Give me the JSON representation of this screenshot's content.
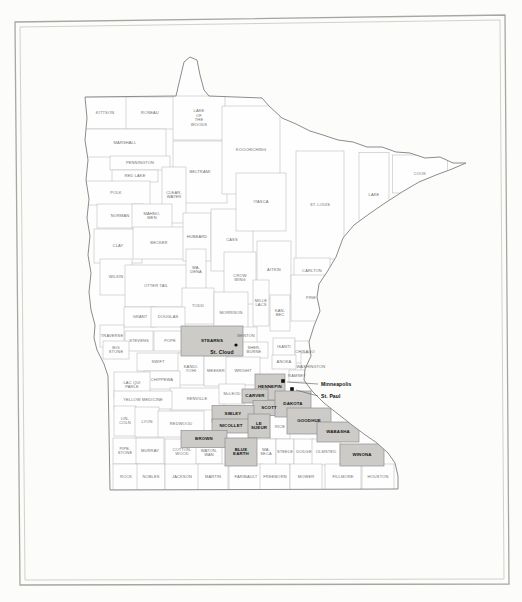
{
  "colors": {
    "paper": "#fcfcfb",
    "frame_outer": "#a9a6a0",
    "frame_inner": "#c8c5c0",
    "county_line": "#b2b2b2",
    "county_fill": "#fefefe",
    "state_line": "#8c8c8c",
    "highlight_fill": "#cccbc8",
    "highlight_line": "#8f8f8f",
    "label": "#6e6e6e",
    "label_highlight": "#161616",
    "city": "#111111",
    "leader_line": "#555555"
  },
  "map": {
    "counties": [
      {
        "name": "KITTSON",
        "x": 105,
        "y": 113,
        "w": 44,
        "h": 32,
        "hl": false
      },
      {
        "name": "ROSEAU",
        "x": 150,
        "y": 113,
        "w": 48,
        "h": 32,
        "hl": false
      },
      {
        "name": "LAKE OF THE WOODS",
        "x": 199,
        "y": 118,
        "w": 52,
        "h": 44,
        "hl": false,
        "lines": [
          "LAKE",
          "OF",
          "THE",
          "WOODS"
        ]
      },
      {
        "name": "MARSHALL",
        "x": 125,
        "y": 143,
        "w": 82,
        "h": 28,
        "hl": false
      },
      {
        "name": "PENNINGTON",
        "x": 140,
        "y": 163,
        "w": 60,
        "h": 14,
        "hl": false
      },
      {
        "name": "RED LAKE",
        "x": 135,
        "y": 176,
        "w": 46,
        "h": 12,
        "hl": false
      },
      {
        "name": "BELTRAMI",
        "x": 200,
        "y": 172,
        "w": 54,
        "h": 62,
        "hl": false
      },
      {
        "name": "KOOCHICHING",
        "x": 251,
        "y": 150,
        "w": 58,
        "h": 88,
        "hl": false
      },
      {
        "name": "POLK",
        "x": 116,
        "y": 193,
        "w": 68,
        "h": 24,
        "hl": false
      },
      {
        "name": "CLEARWATER",
        "x": 174,
        "y": 195,
        "w": 24,
        "h": 56,
        "hl": false,
        "lines": [
          "CLEAR-",
          "WATER"
        ]
      },
      {
        "name": "NORMAN",
        "x": 120,
        "y": 216,
        "w": 46,
        "h": 24,
        "hl": false
      },
      {
        "name": "MAHNOMEN",
        "x": 152,
        "y": 216,
        "w": 40,
        "h": 24,
        "hl": false,
        "lines": [
          "MAHNO-",
          "MEN"
        ]
      },
      {
        "name": "CLAY",
        "x": 118,
        "y": 246,
        "w": 48,
        "h": 34,
        "hl": false
      },
      {
        "name": "BECKER",
        "x": 159,
        "y": 243,
        "w": 52,
        "h": 32,
        "hl": false
      },
      {
        "name": "HUBBARD",
        "x": 197,
        "y": 237,
        "w": 28,
        "h": 48,
        "hl": false
      },
      {
        "name": "CASS",
        "x": 232,
        "y": 240,
        "w": 42,
        "h": 62,
        "hl": false
      },
      {
        "name": "ITASCA",
        "x": 261,
        "y": 202,
        "w": 50,
        "h": 58,
        "hl": false
      },
      {
        "name": "ST. LOUIS",
        "x": 320,
        "y": 205,
        "w": 48,
        "h": 108,
        "hl": false
      },
      {
        "name": "LAKE",
        "x": 374,
        "y": 195,
        "w": 30,
        "h": 85,
        "hl": false
      },
      {
        "name": "COOK",
        "x": 420,
        "y": 174,
        "w": 55,
        "h": 38,
        "hl": false
      },
      {
        "name": "WILKIN",
        "x": 116,
        "y": 277,
        "w": 32,
        "h": 36,
        "hl": false
      },
      {
        "name": "OTTER TAIL",
        "x": 156,
        "y": 286,
        "w": 62,
        "h": 42,
        "hl": false
      },
      {
        "name": "WADENA",
        "x": 196,
        "y": 270,
        "w": 20,
        "h": 42,
        "hl": false,
        "lines": [
          "WA-",
          "DENA"
        ]
      },
      {
        "name": "CROW WING",
        "x": 240,
        "y": 278,
        "w": 32,
        "h": 52,
        "hl": false,
        "lines": [
          "CROW",
          "WING"
        ]
      },
      {
        "name": "AITKIN",
        "x": 274,
        "y": 270,
        "w": 34,
        "h": 58,
        "hl": false
      },
      {
        "name": "CARLTON",
        "x": 312,
        "y": 271,
        "w": 36,
        "h": 26,
        "hl": false
      },
      {
        "name": "TODD",
        "x": 198,
        "y": 306,
        "w": 32,
        "h": 36,
        "hl": false
      },
      {
        "name": "MORRISON",
        "x": 231,
        "y": 313,
        "w": 34,
        "h": 42,
        "hl": false
      },
      {
        "name": "MILLE LACS",
        "x": 261,
        "y": 303,
        "w": 16,
        "h": 46,
        "hl": false,
        "lines": [
          "MILLE",
          "LACS"
        ]
      },
      {
        "name": "KANABEC",
        "x": 280,
        "y": 313,
        "w": 20,
        "h": 36,
        "hl": false,
        "lines": [
          "KAN-",
          "BEC"
        ]
      },
      {
        "name": "PINE",
        "x": 311,
        "y": 298,
        "w": 40,
        "h": 46,
        "hl": false
      },
      {
        "name": "GRANT",
        "x": 140,
        "y": 317,
        "w": 32,
        "h": 20,
        "hl": false
      },
      {
        "name": "DOUGLAS",
        "x": 168,
        "y": 317,
        "w": 34,
        "h": 20,
        "hl": false
      },
      {
        "name": "TRAVERSE",
        "x": 112,
        "y": 336,
        "w": 24,
        "h": 22,
        "hl": false
      },
      {
        "name": "STEVENS",
        "x": 139,
        "y": 341,
        "w": 28,
        "h": 20,
        "hl": false
      },
      {
        "name": "POPE",
        "x": 170,
        "y": 341,
        "w": 32,
        "h": 20,
        "hl": false
      },
      {
        "name": "BIG STONE",
        "x": 116,
        "y": 350,
        "w": 26,
        "h": 18,
        "hl": false,
        "lines": [
          "BIG",
          "STONE"
        ]
      },
      {
        "name": "STEARNS",
        "x": 212,
        "y": 341,
        "w": 62,
        "h": 30,
        "hl": true
      },
      {
        "name": "BENTON",
        "x": 246,
        "y": 336,
        "w": 22,
        "h": 18,
        "hl": false
      },
      {
        "name": "SHERBURNE",
        "x": 254,
        "y": 350,
        "w": 28,
        "h": 16,
        "hl": false,
        "lines": [
          "SHER-",
          "BURNE"
        ]
      },
      {
        "name": "ISANTI",
        "x": 284,
        "y": 347,
        "w": 22,
        "h": 18,
        "hl": false
      },
      {
        "name": "CHISAGO",
        "x": 305,
        "y": 352,
        "w": 20,
        "h": 22,
        "hl": false
      },
      {
        "name": "ANOKA",
        "x": 284,
        "y": 362,
        "w": 24,
        "h": 14,
        "hl": false
      },
      {
        "name": "SWIFT",
        "x": 158,
        "y": 362,
        "w": 42,
        "h": 18,
        "hl": false
      },
      {
        "name": "KANDIYOHI",
        "x": 191,
        "y": 369,
        "w": 26,
        "h": 32,
        "hl": false,
        "lines": [
          "KANDI-",
          "YOHI"
        ]
      },
      {
        "name": "MEEKER",
        "x": 216,
        "y": 371,
        "w": 24,
        "h": 30,
        "hl": false
      },
      {
        "name": "WRIGHT",
        "x": 243,
        "y": 371,
        "w": 34,
        "h": 28,
        "hl": false
      },
      {
        "name": "CHIPPEWA",
        "x": 162,
        "y": 380,
        "w": 36,
        "h": 18,
        "hl": false
      },
      {
        "name": "LAC QUI PARLE",
        "x": 132,
        "y": 385,
        "w": 36,
        "h": 26,
        "hl": false,
        "lines": [
          "LAC QUI",
          "PARLE"
        ]
      },
      {
        "name": "RENVILLE",
        "x": 197,
        "y": 399,
        "w": 54,
        "h": 22,
        "hl": false
      },
      {
        "name": "McLEOD",
        "x": 232,
        "y": 394,
        "w": 26,
        "h": 20,
        "hl": false
      },
      {
        "name": "WASHINGTON",
        "x": 311,
        "y": 367,
        "w": 20,
        "h": 28,
        "hl": false
      },
      {
        "name": "RAMSEY",
        "x": 297,
        "y": 376,
        "w": 16,
        "h": 12,
        "hl": false
      },
      {
        "name": "HENNEPIN",
        "x": 270,
        "y": 387,
        "w": 30,
        "h": 26,
        "hl": true
      },
      {
        "name": "CARVER",
        "x": 255,
        "y": 396,
        "w": 26,
        "h": 14,
        "hl": true
      },
      {
        "name": "SCOTT",
        "x": 269,
        "y": 408,
        "w": 32,
        "h": 15,
        "hl": true
      },
      {
        "name": "DAKOTA",
        "x": 293,
        "y": 404,
        "w": 36,
        "h": 26,
        "hl": true
      },
      {
        "name": "YELLOW MEDICINE",
        "x": 143,
        "y": 400,
        "w": 58,
        "h": 18,
        "hl": false
      },
      {
        "name": "LINCOLN",
        "x": 125,
        "y": 421,
        "w": 22,
        "h": 30,
        "hl": false,
        "lines": [
          "LIN-",
          "COLN"
        ]
      },
      {
        "name": "LYON",
        "x": 147,
        "y": 422,
        "w": 24,
        "h": 30,
        "hl": false
      },
      {
        "name": "REDWOOD",
        "x": 181,
        "y": 424,
        "w": 46,
        "h": 26,
        "hl": false
      },
      {
        "name": "SIBLEY",
        "x": 233,
        "y": 414,
        "w": 42,
        "h": 17,
        "hl": true
      },
      {
        "name": "NICOLLET",
        "x": 231,
        "y": 426,
        "w": 38,
        "h": 14,
        "hl": true
      },
      {
        "name": "LE SUEUR",
        "x": 259,
        "y": 426,
        "w": 22,
        "h": 24,
        "hl": true,
        "lines": [
          "LE",
          "SUEUR"
        ]
      },
      {
        "name": "RICE",
        "x": 280,
        "y": 427,
        "w": 20,
        "h": 24,
        "hl": false
      },
      {
        "name": "GOODHUE",
        "x": 309,
        "y": 421,
        "w": 44,
        "h": 26,
        "hl": true
      },
      {
        "name": "WABASHA",
        "x": 338,
        "y": 432,
        "w": 42,
        "h": 20,
        "hl": true
      },
      {
        "name": "PIPESTONE",
        "x": 125,
        "y": 451,
        "w": 24,
        "h": 26,
        "hl": false,
        "lines": [
          "PIPE-",
          "STONE"
        ]
      },
      {
        "name": "MURRAY",
        "x": 150,
        "y": 451,
        "w": 28,
        "h": 26,
        "hl": false
      },
      {
        "name": "COTTONWOOD",
        "x": 182,
        "y": 452,
        "w": 34,
        "h": 26,
        "hl": false,
        "lines": [
          "COTTON-",
          "WOOD"
        ]
      },
      {
        "name": "WATONWAN",
        "x": 209,
        "y": 453,
        "w": 26,
        "h": 22,
        "hl": false,
        "lines": [
          "WATON-",
          "WAN"
        ]
      },
      {
        "name": "BROWN",
        "x": 204,
        "y": 439,
        "w": 46,
        "h": 17,
        "hl": true
      },
      {
        "name": "BLUE EARTH",
        "x": 241,
        "y": 452,
        "w": 32,
        "h": 28,
        "hl": true,
        "lines": [
          "BLUE",
          "EARTH"
        ]
      },
      {
        "name": "WASECA",
        "x": 266,
        "y": 452,
        "w": 20,
        "h": 26,
        "hl": false,
        "lines": [
          "WA-",
          "SECA"
        ]
      },
      {
        "name": "STEELE",
        "x": 285,
        "y": 452,
        "w": 18,
        "h": 26,
        "hl": false
      },
      {
        "name": "DODGE",
        "x": 304,
        "y": 452,
        "w": 20,
        "h": 26,
        "hl": false
      },
      {
        "name": "OLMSTED",
        "x": 326,
        "y": 452,
        "w": 28,
        "h": 26,
        "hl": false
      },
      {
        "name": "WINONA",
        "x": 362,
        "y": 455,
        "w": 44,
        "h": 22,
        "hl": true
      },
      {
        "name": "ROCK",
        "x": 126,
        "y": 477,
        "w": 26,
        "h": 26,
        "hl": false
      },
      {
        "name": "NOBLES",
        "x": 151,
        "y": 477,
        "w": 28,
        "h": 26,
        "hl": false
      },
      {
        "name": "JACKSON",
        "x": 182,
        "y": 477,
        "w": 34,
        "h": 26,
        "hl": false
      },
      {
        "name": "MARTIN",
        "x": 213,
        "y": 477,
        "w": 30,
        "h": 26,
        "hl": false
      },
      {
        "name": "FARIBAULT",
        "x": 246,
        "y": 477,
        "w": 34,
        "h": 26,
        "hl": false
      },
      {
        "name": "FREEBORN",
        "x": 275,
        "y": 477,
        "w": 30,
        "h": 26,
        "hl": false
      },
      {
        "name": "MOWER",
        "x": 306,
        "y": 477,
        "w": 32,
        "h": 26,
        "hl": false
      },
      {
        "name": "FILLMORE",
        "x": 343,
        "y": 477,
        "w": 36,
        "h": 26,
        "hl": false
      },
      {
        "name": "HOUSTON",
        "x": 378,
        "y": 477,
        "w": 32,
        "h": 26,
        "hl": false
      }
    ],
    "cities": [
      {
        "name": "St. Cloud",
        "marker": "dot",
        "mx": 236,
        "my": 345,
        "lx": 222,
        "ly": 353,
        "anchor": "middle"
      },
      {
        "name": "Minneapolis",
        "marker": "square",
        "mx": 283,
        "my": 381,
        "lx": 321,
        "ly": 385,
        "anchor": "start",
        "leader": [
          287,
          382,
          318,
          384
        ]
      },
      {
        "name": "St. Paul",
        "marker": "square",
        "mx": 292,
        "my": 389,
        "lx": 321,
        "ly": 397,
        "anchor": "start",
        "leader": [
          296,
          390,
          318,
          396
        ]
      }
    ]
  }
}
